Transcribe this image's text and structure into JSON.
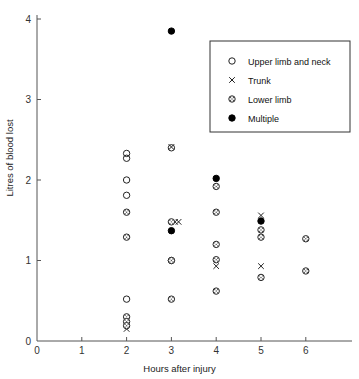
{
  "chart_data": {
    "type": "scatter",
    "title": "",
    "xlabel": "Hours after injury",
    "ylabel": "Litres of blood lost",
    "xlim": [
      0,
      7
    ],
    "ylim": [
      0,
      4.15
    ],
    "xticks": [
      0,
      1,
      2,
      3,
      4,
      5,
      6
    ],
    "yticks": [
      0,
      1,
      2,
      3,
      4
    ],
    "grid": false,
    "legend_position": "top-right",
    "legend_entries": [
      {
        "label": "Upper limb and neck",
        "marker": "open-circle"
      },
      {
        "label": "Trunk",
        "marker": "cross"
      },
      {
        "label": "Lower limb",
        "marker": "dotted-circle"
      },
      {
        "label": "Multiple",
        "marker": "filled-circle"
      }
    ],
    "series": [
      {
        "name": "Upper limb and neck",
        "marker": "open-circle",
        "points": [
          [
            2,
            2.33
          ],
          [
            2,
            2.27
          ],
          [
            2,
            2.0
          ],
          [
            2,
            1.81
          ],
          [
            2,
            0.52
          ],
          [
            3,
            2.4
          ],
          [
            3,
            1.0
          ],
          [
            4,
            3.03
          ]
        ]
      },
      {
        "name": "Trunk",
        "marker": "cross",
        "points": [
          [
            2,
            0.15
          ],
          [
            3,
            2.41
          ],
          [
            3.08,
            1.48
          ],
          [
            3.16,
            1.48
          ],
          [
            4,
            0.93
          ],
          [
            5,
            1.56
          ],
          [
            5,
            0.93
          ]
        ]
      },
      {
        "name": "Lower limb",
        "marker": "dotted-circle",
        "points": [
          [
            2,
            1.6
          ],
          [
            2,
            1.29
          ],
          [
            2,
            0.3
          ],
          [
            2,
            0.24
          ],
          [
            2,
            0.19
          ],
          [
            3,
            1.48
          ],
          [
            3,
            1.0
          ],
          [
            3,
            0.52
          ],
          [
            4,
            2.86
          ],
          [
            4,
            1.92
          ],
          [
            4,
            1.6
          ],
          [
            4,
            1.2
          ],
          [
            4,
            1.01
          ],
          [
            4,
            0.62
          ],
          [
            5,
            1.38
          ],
          [
            5,
            1.29
          ],
          [
            5,
            0.79
          ],
          [
            6,
            1.27
          ],
          [
            6,
            0.87
          ]
        ]
      },
      {
        "name": "Multiple",
        "marker": "filled-circle",
        "points": [
          [
            3,
            3.85
          ],
          [
            3,
            1.37
          ],
          [
            4,
            2.02
          ],
          [
            5,
            1.49
          ]
        ]
      }
    ]
  }
}
